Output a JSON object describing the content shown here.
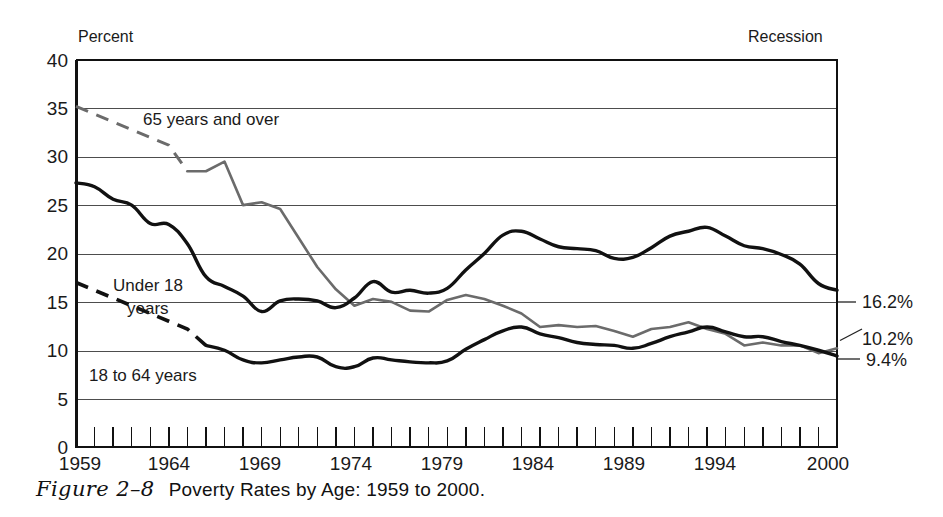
{
  "figure": {
    "number_label": "Figure 2–8",
    "title": "Poverty Rates by Age: 1959 to 2000.",
    "recession_legend_label": "Recession"
  },
  "chart_data": {
    "type": "line",
    "title": "Poverty Rates by Age: 1959 to 2000.",
    "xlabel": "",
    "ylabel": "Percent",
    "ylim": [
      0,
      40
    ],
    "xlim": [
      1959,
      2000
    ],
    "ytick_values": [
      0,
      5,
      10,
      15,
      20,
      25,
      30,
      35,
      40
    ],
    "ytick_labels": [
      "0",
      "5",
      "10",
      "15",
      "20",
      "25",
      "30",
      "35",
      "40"
    ],
    "xtick_labels": [
      "1959",
      "1964",
      "1969",
      "1974",
      "1979",
      "1984",
      "1989",
      "1994",
      "2000"
    ],
    "xtick_values": [
      1959,
      1964,
      1969,
      1974,
      1979,
      1984,
      1989,
      1994,
      2000
    ],
    "minor_xticks_every": 1,
    "grid": "horizontal",
    "legend_position": "inline-annotations",
    "x": [
      1959,
      1960,
      1961,
      1962,
      1963,
      1964,
      1965,
      1966,
      1967,
      1968,
      1969,
      1970,
      1971,
      1972,
      1973,
      1974,
      1975,
      1976,
      1977,
      1978,
      1979,
      1980,
      1981,
      1982,
      1983,
      1984,
      1985,
      1986,
      1987,
      1988,
      1989,
      1990,
      1991,
      1992,
      1993,
      1994,
      1995,
      1996,
      1997,
      1998,
      1999,
      2000
    ],
    "series": [
      {
        "name": "65 years and over",
        "color": "#6b6b6b",
        "annotation": "65 years and over",
        "estimated_segment_years": [
          1959,
          1965
        ],
        "end_value_label": "10.2%",
        "end_value": 10.2,
        "values": [
          35.2,
          34.4,
          33.6,
          32.8,
          32.0,
          31.2,
          28.5,
          28.5,
          29.5,
          25.0,
          25.3,
          24.6,
          21.6,
          18.6,
          16.3,
          14.6,
          15.3,
          15.0,
          14.1,
          14.0,
          15.2,
          15.7,
          15.3,
          14.6,
          13.8,
          12.4,
          12.6,
          12.4,
          12.5,
          12.0,
          11.4,
          12.2,
          12.4,
          12.9,
          12.2,
          11.7,
          10.5,
          10.8,
          10.5,
          10.5,
          9.7,
          10.2
        ]
      },
      {
        "name": "Under 18 years",
        "color": "#111111",
        "annotation": "Under 18 years",
        "end_value_label": "16.2%",
        "end_value": 16.2,
        "values": [
          27.3,
          26.9,
          25.6,
          25.0,
          23.1,
          23.0,
          21.0,
          17.6,
          16.6,
          15.6,
          14.0,
          15.1,
          15.3,
          15.1,
          14.4,
          15.4,
          17.1,
          16.0,
          16.2,
          15.9,
          16.4,
          18.3,
          20.0,
          21.9,
          22.3,
          21.5,
          20.7,
          20.5,
          20.3,
          19.5,
          19.6,
          20.6,
          21.8,
          22.3,
          22.7,
          21.8,
          20.8,
          20.5,
          19.9,
          18.9,
          16.9,
          16.2
        ]
      },
      {
        "name": "18 to 64 years",
        "color": "#111111",
        "annotation": "18 to 64 years",
        "estimated_segment_years": [
          1959,
          1966
        ],
        "end_value_label": "9.4%",
        "end_value": 9.4,
        "values": [
          17.0,
          16.2,
          15.4,
          14.6,
          13.8,
          13.0,
          12.2,
          10.5,
          10.0,
          9.0,
          8.7,
          9.0,
          9.3,
          9.3,
          8.3,
          8.3,
          9.2,
          9.0,
          8.8,
          8.7,
          8.9,
          10.1,
          11.1,
          12.0,
          12.4,
          11.7,
          11.3,
          10.8,
          10.6,
          10.5,
          10.2,
          10.7,
          11.4,
          11.9,
          12.4,
          11.9,
          11.4,
          11.4,
          10.9,
          10.5,
          10.0,
          9.4
        ]
      }
    ],
    "right_end_labels": [
      {
        "label": "16.2%",
        "value": 16.2
      },
      {
        "label": "10.2%",
        "value": 10.2
      },
      {
        "label": "9.4%",
        "value": 9.4
      }
    ]
  }
}
